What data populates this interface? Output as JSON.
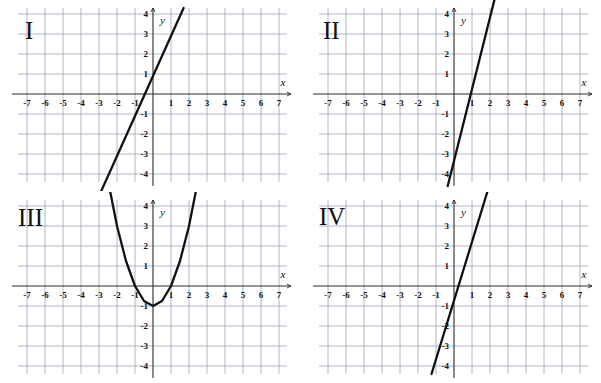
{
  "figure": {
    "title": "",
    "panel_count": 4,
    "layout": "2x2 grid of coordinate planes",
    "grid_color": "#a7aebb",
    "axis_color": "#2b2b2b",
    "curve_color": "#111111",
    "background": "#ffffff"
  },
  "axis_labels": {
    "x": "x",
    "y": "y"
  },
  "x_ticks": [
    "-7",
    "-6",
    "-5",
    "-4",
    "-3",
    "-2",
    "-1",
    "1",
    "2",
    "3",
    "4",
    "5",
    "6",
    "7"
  ],
  "y_ticks": [
    "4",
    "3",
    "2",
    "1",
    "-1",
    "-2",
    "-3",
    "-4"
  ],
  "panels": [
    {
      "id": "I",
      "label": "I"
    },
    {
      "id": "II",
      "label": "II"
    },
    {
      "id": "III",
      "label": "III"
    },
    {
      "id": "IV",
      "label": "IV"
    }
  ],
  "chart_data": [
    {
      "type": "line",
      "title": "I",
      "xlabel": "x",
      "ylabel": "y",
      "xlim": [
        -7.8,
        7.8
      ],
      "ylim": [
        -4.6,
        4.6
      ],
      "grid": true,
      "xticks": [
        -7,
        -6,
        -5,
        -4,
        -3,
        -2,
        -1,
        1,
        2,
        3,
        4,
        5,
        6,
        7
      ],
      "yticks": [
        4,
        3,
        2,
        1,
        -1,
        -2,
        -3,
        -4
      ],
      "legend": "none",
      "series": [
        {
          "name": "line-I",
          "shape": "straight-line",
          "slope": 2,
          "y_intercept": 0.9,
          "x_intercept": -0.45,
          "x": [
            -3.2,
            1.7
          ],
          "y": [
            -5.5,
            4.3
          ],
          "drawn_from": [
            -3.2,
            -5.5
          ],
          "drawn_to": [
            1.7,
            4.3
          ]
        }
      ]
    },
    {
      "type": "line",
      "title": "II",
      "xlabel": "x",
      "ylabel": "y",
      "xlim": [
        -7.8,
        7.8
      ],
      "ylim": [
        -4.6,
        4.6
      ],
      "grid": true,
      "xticks": [
        -7,
        -6,
        -5,
        -4,
        -3,
        -2,
        -1,
        1,
        2,
        3,
        4,
        5,
        6,
        7
      ],
      "yticks": [
        4,
        3,
        2,
        1,
        -1,
        -2,
        -3,
        -4
      ],
      "legend": "none",
      "series": [
        {
          "name": "line-II",
          "shape": "straight-line",
          "slope": 3.6,
          "y_intercept": -3.3,
          "x_intercept": 0.92,
          "x": [
            -0.35,
            2.3
          ],
          "y": [
            -4.6,
            4.9
          ],
          "drawn_from": [
            -0.35,
            -4.6
          ],
          "drawn_to": [
            2.3,
            4.9
          ]
        }
      ]
    },
    {
      "type": "line",
      "title": "III",
      "xlabel": "x",
      "ylabel": "y",
      "xlim": [
        -7.8,
        7.8
      ],
      "ylim": [
        -4.6,
        4.6
      ],
      "grid": true,
      "xticks": [
        -7,
        -6,
        -5,
        -4,
        -3,
        -2,
        -1,
        1,
        2,
        3,
        4,
        5,
        6,
        7
      ],
      "yticks": [
        4,
        3,
        2,
        1,
        -1,
        -2,
        -3,
        -4
      ],
      "legend": "none",
      "series": [
        {
          "name": "parabola-III",
          "shape": "parabola",
          "equation": "y = x^2 - 1",
          "vertex": [
            0,
            -1
          ],
          "x_intercepts": [
            -1,
            1
          ],
          "y_intercept": -1,
          "opens": "up",
          "x": [
            -2.55,
            -2.0,
            -1.5,
            -1.0,
            -0.5,
            0,
            0.5,
            1.0,
            1.5,
            2.0,
            2.55
          ],
          "y": [
            5.5,
            3.0,
            1.25,
            0,
            -0.75,
            -1,
            -0.75,
            0,
            1.25,
            3.0,
            5.5
          ]
        }
      ]
    },
    {
      "type": "line",
      "title": "IV",
      "xlabel": "x",
      "ylabel": "y",
      "xlim": [
        -7.8,
        7.8
      ],
      "ylim": [
        -4.6,
        4.6
      ],
      "grid": true,
      "xticks": [
        -7,
        -6,
        -5,
        -4,
        -3,
        -2,
        -1,
        1,
        2,
        3,
        4,
        5,
        6,
        7
      ],
      "yticks": [
        4,
        3,
        2,
        1,
        -1,
        -2,
        -3,
        -4
      ],
      "legend": "none",
      "series": [
        {
          "name": "line-IV",
          "shape": "straight-line",
          "slope": 2.9,
          "y_intercept": -0.7,
          "x_intercept": 0.24,
          "x": [
            -1.25,
            1.85
          ],
          "y": [
            -4.4,
            4.7
          ],
          "drawn_from": [
            -1.25,
            -4.4
          ],
          "drawn_to": [
            1.85,
            4.7
          ]
        }
      ]
    }
  ]
}
